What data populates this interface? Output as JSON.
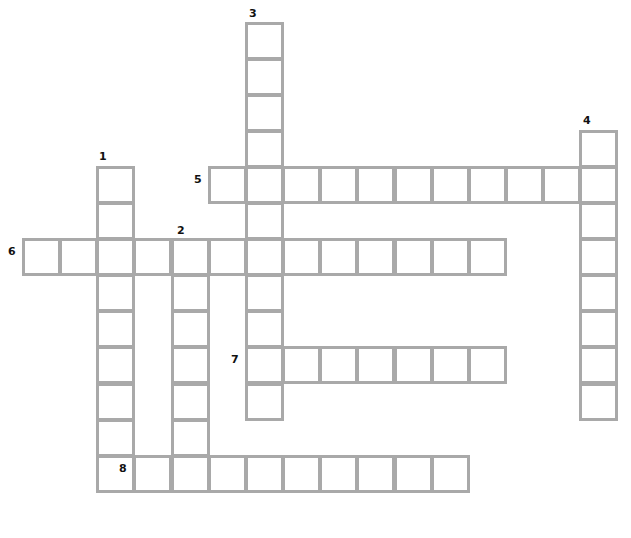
{
  "puzzle": {
    "type": "crossword",
    "grid": {
      "origin_x": 22,
      "origin_y": 22,
      "cell_w": 37.15,
      "cell_h": 36.05,
      "cols": 16,
      "rows": 13
    },
    "colors": {
      "border": "#a9a9a9",
      "cell_fill": "#ffffff",
      "number": "#111111"
    },
    "words": [
      {
        "number": "1",
        "direction": "down",
        "row": 4,
        "col": 2,
        "length": 9,
        "num_dx": 3,
        "num_dy": -15
      },
      {
        "number": "2",
        "direction": "down",
        "row": 6,
        "col": 4,
        "length": 7,
        "num_dx": 6,
        "num_dy": -13
      },
      {
        "number": "3",
        "direction": "down",
        "row": 0,
        "col": 6,
        "length": 11,
        "num_dx": 4,
        "num_dy": -14
      },
      {
        "number": "4",
        "direction": "down",
        "row": 3,
        "col": 15,
        "length": 8,
        "num_dx": 4,
        "num_dy": -15
      },
      {
        "number": "5",
        "direction": "across",
        "row": 4,
        "col": 5,
        "length": 11,
        "num_dx": -14,
        "num_dy": 8
      },
      {
        "number": "6",
        "direction": "across",
        "row": 6,
        "col": 0,
        "length": 13,
        "num_dx": -14,
        "num_dy": 8
      },
      {
        "number": "7",
        "direction": "across",
        "row": 9,
        "col": 6,
        "length": 7,
        "num_dx": -14,
        "num_dy": 8
      },
      {
        "number": "8",
        "direction": "across",
        "row": 12,
        "col": 3,
        "length": 9,
        "num_dx": -14,
        "num_dy": 8
      }
    ]
  }
}
